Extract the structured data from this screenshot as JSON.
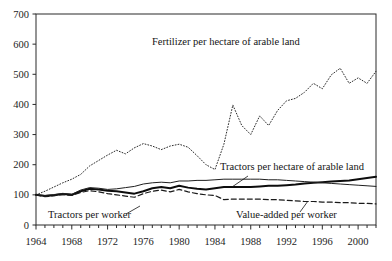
{
  "figure": {
    "background_color": "#ffffff",
    "ink_color": "#1a1a1a",
    "cropped_caption": "Figure 2. Agricultural inputs and productivity (index 1964 = 100)"
  },
  "axes": {
    "x_ticks_labeled": [
      "1964",
      "1968",
      "1972",
      "1976",
      "1980",
      "1984",
      "1988",
      "1992",
      "1996",
      "2000"
    ],
    "y_ticks_labeled": [
      "0",
      "100",
      "200",
      "300",
      "400",
      "500",
      "600",
      "700"
    ],
    "x_min": 1964,
    "x_max": 2002,
    "y_min": 0,
    "y_max": 700,
    "x_tick_step": 1,
    "x_label_step": 4,
    "y_tick_step": 100,
    "grid": "off",
    "frame": "box"
  },
  "annotations": [
    {
      "name": "fertilizer-label",
      "text": "Fertilizer per hectare of arable land",
      "x": 152,
      "y": 45,
      "leader": false
    },
    {
      "name": "tractors-hectare-label",
      "text": "Tractors per hectare of arable land",
      "x": 220,
      "y": 170,
      "leader": true
    },
    {
      "name": "tractors-worker-label",
      "text": "Tractors per worker",
      "x": 48,
      "y": 218,
      "leader": true
    },
    {
      "name": "value-added-label",
      "text": "Value-added per worker",
      "x": 236,
      "y": 218,
      "leader": true
    }
  ],
  "chart_data": {
    "type": "line",
    "title": "",
    "subtitle": "",
    "xlabel": "",
    "ylabel": "",
    "xlim": [
      1964,
      2002
    ],
    "ylim": [
      0,
      700
    ],
    "grid": false,
    "legend_position": "inline-annotations",
    "x": [
      1964,
      1965,
      1966,
      1967,
      1968,
      1969,
      1970,
      1971,
      1972,
      1973,
      1974,
      1975,
      1976,
      1977,
      1978,
      1979,
      1980,
      1981,
      1982,
      1983,
      1984,
      1985,
      1986,
      1987,
      1988,
      1989,
      1990,
      1991,
      1992,
      1993,
      1994,
      1995,
      1996,
      1997,
      1998,
      1999,
      2000,
      2001,
      2002
    ],
    "series": [
      {
        "name": "Fertilizer per hectare of arable land",
        "style": "dotted",
        "width": 1.0,
        "color": "#2a2a2a",
        "values": [
          100,
          112,
          126,
          140,
          152,
          168,
          196,
          214,
          232,
          248,
          236,
          256,
          270,
          262,
          250,
          262,
          268,
          258,
          230,
          200,
          184,
          268,
          398,
          330,
          300,
          362,
          330,
          380,
          412,
          420,
          440,
          470,
          452,
          498,
          520,
          470,
          488,
          470,
          510
        ]
      },
      {
        "name": "Tractors per hectare of arable land",
        "style": "solid-thick",
        "width": 2.0,
        "color": "#0d0d0d",
        "values": [
          100,
          96,
          99,
          103,
          100,
          112,
          120,
          118,
          114,
          112,
          108,
          104,
          112,
          122,
          126,
          122,
          130,
          124,
          120,
          118,
          122,
          126,
          126,
          126,
          126,
          128,
          130,
          130,
          132,
          134,
          138,
          140,
          142,
          144,
          146,
          148,
          152,
          156,
          160
        ]
      },
      {
        "name": "Tractors per worker",
        "style": "solid-thin",
        "width": 1.0,
        "color": "#1f1f1f",
        "values": [
          100,
          98,
          101,
          105,
          102,
          116,
          124,
          122,
          118,
          120,
          124,
          128,
          136,
          140,
          142,
          140,
          146,
          146,
          148,
          148,
          150,
          152,
          152,
          152,
          152,
          152,
          150,
          150,
          148,
          146,
          144,
          142,
          140,
          138,
          136,
          134,
          132,
          130,
          128
        ]
      },
      {
        "name": "Value-added per worker",
        "style": "dashed",
        "width": 1.2,
        "color": "#1a1a1a",
        "values": [
          100,
          94,
          97,
          101,
          98,
          108,
          114,
          110,
          104,
          100,
          96,
          92,
          104,
          112,
          116,
          110,
          118,
          110,
          104,
          100,
          98,
          84,
          86,
          86,
          86,
          86,
          84,
          84,
          82,
          80,
          78,
          78,
          76,
          76,
          74,
          74,
          72,
          72,
          70
        ]
      }
    ]
  }
}
